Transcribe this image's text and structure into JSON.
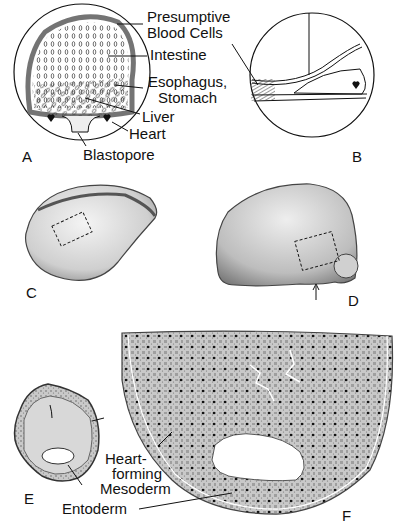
{
  "figure": {
    "panels": [
      {
        "id": "A",
        "label": "A"
      },
      {
        "id": "B",
        "label": "B"
      },
      {
        "id": "C",
        "label": "C"
      },
      {
        "id": "D",
        "label": "D"
      },
      {
        "id": "E",
        "label": "E"
      },
      {
        "id": "F",
        "label": "F"
      }
    ],
    "labels_A": {
      "presumptive_line1": "Presumptive",
      "presumptive_line2": "Blood Cells",
      "intestine": "Intestine",
      "esophagus_line1": "Esophagus,",
      "esophagus_line2": "Stomach",
      "liver": "Liver",
      "heart": "Heart",
      "blastopore": "Blastopore"
    },
    "labels_EF": {
      "heart_line1": "Heart-",
      "heart_line2": "forming",
      "heart_line3": "Mesoderm",
      "entoderm": "Entoderm"
    },
    "colors": {
      "ink": "#111111",
      "paper": "#ffffff",
      "stipple": "#9a9a9a"
    }
  }
}
